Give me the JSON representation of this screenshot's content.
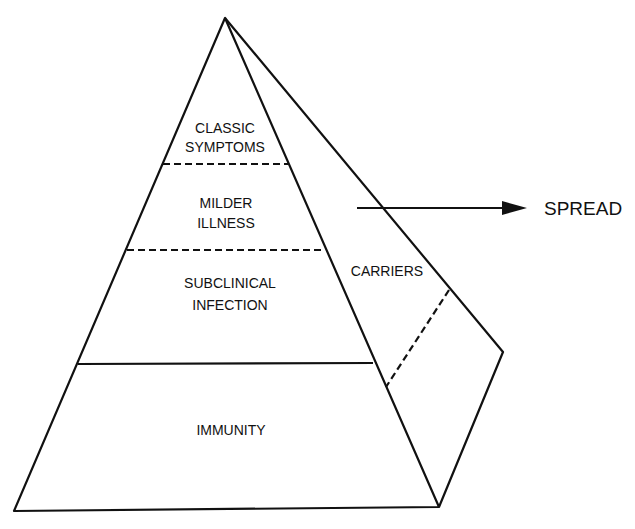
{
  "diagram": {
    "type": "pyramid",
    "title": "",
    "front_face_levels": [
      {
        "id": "classic",
        "lines": [
          "CLASSIC",
          "SYMPTOMS"
        ],
        "boundary_below": "dashed"
      },
      {
        "id": "milder",
        "lines": [
          "MILDER",
          "ILLNESS"
        ],
        "boundary_below": "dashed"
      },
      {
        "id": "subclinical",
        "lines": [
          "SUBCLINICAL",
          "INFECTION"
        ],
        "boundary_below": "solid"
      },
      {
        "id": "immunity",
        "lines": [
          "IMMUNITY"
        ],
        "boundary_below": "solid"
      }
    ],
    "side_face": {
      "label": "CARRIERS",
      "divider": "dashed"
    },
    "arrow": {
      "label": "SPREAD",
      "direction": "right"
    },
    "colors": {
      "stroke": "#111111",
      "background": "#ffffff"
    }
  }
}
